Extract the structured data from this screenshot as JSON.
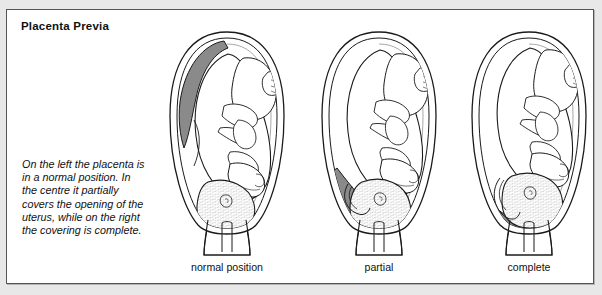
{
  "figure": {
    "title": "Placenta Previa",
    "caption": "On the left the placenta is in a normal position. In the centre it partially covers the opening of the uterus, while on the right the covering is complete.",
    "colors": {
      "placenta_gray": "#8a8a8a",
      "outline": "#1a1a1a",
      "frame_border": "#555555",
      "page_background": "#e8e8e8",
      "panel_background": "#ffffff",
      "text": "#111111"
    },
    "panels": [
      {
        "id": "normal-position",
        "label": "normal position",
        "placenta_location": "upper-left fundus",
        "placenta_covers_os": "none"
      },
      {
        "id": "partial",
        "label": "partial",
        "placenta_location": "lower-left segment",
        "placenta_covers_os": "partial"
      },
      {
        "id": "complete",
        "label": "complete",
        "placenta_location": "lower segment spanning cervix",
        "placenta_covers_os": "complete"
      }
    ],
    "anatomy_parts": [
      "uterus-wall",
      "uterine-cavity",
      "placenta",
      "fetus",
      "fetal-head",
      "umbilical-cord",
      "cervix",
      "cervical-canal",
      "vagina"
    ]
  }
}
